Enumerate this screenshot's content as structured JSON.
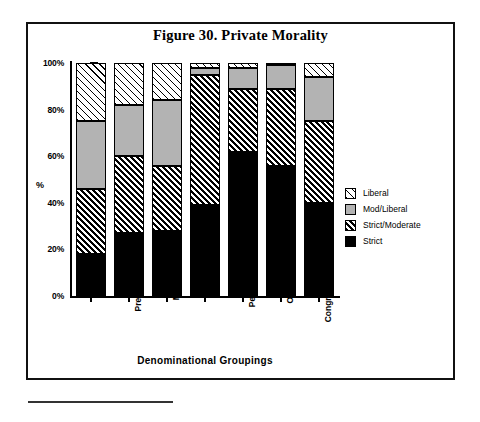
{
  "figure": {
    "title": "Figure 30. Private Morality",
    "frame_border_color": "#111111"
  },
  "chart_data": {
    "type": "bar",
    "subtype": "stacked-100-percent",
    "title": "Figure 30. Private Morality",
    "xlabel": "Denominational  Groupings",
    "ylabel": "%",
    "ylim": [
      0,
      100
    ],
    "ytick_labels": [
      "0%",
      "20%",
      "40%",
      "60%",
      "80%",
      "100%"
    ],
    "ytick_values": [
      0,
      20,
      40,
      60,
      80,
      100
    ],
    "yminor_step": 5,
    "grid": false,
    "legend_position": "right",
    "categories": [
      "C of I",
      "Presbyterian",
      "Methodist",
      "Baptistic",
      "Pent/Charis",
      "Other Pres",
      "Congregational"
    ],
    "series": [
      {
        "name": "Strict",
        "fill": "solid-black",
        "color": "#000000",
        "values": [
          18,
          27,
          28,
          39,
          62,
          56,
          40
        ]
      },
      {
        "name": "Strict/Moderate",
        "fill": "dense-diagonal-hatch",
        "color": "#000000",
        "values": [
          28,
          33,
          28,
          56,
          27,
          33,
          35
        ]
      },
      {
        "name": "Mod/Liberal",
        "fill": "solid-gray",
        "color": "#b3b3b3",
        "values": [
          29,
          22,
          28,
          3,
          9,
          10,
          19
        ]
      },
      {
        "name": "Liberal",
        "fill": "sparse-diagonal-hatch",
        "color": "#ffffff",
        "values": [
          25,
          18,
          16,
          2,
          2,
          1,
          6
        ]
      }
    ],
    "cumulative_tops": [
      [
        18,
        46,
        75,
        100
      ],
      [
        27,
        60,
        82,
        100
      ],
      [
        28,
        56,
        84,
        100
      ],
      [
        39,
        95,
        98,
        100
      ],
      [
        62,
        89,
        98,
        100
      ],
      [
        56,
        89,
        99,
        100
      ],
      [
        40,
        75,
        94,
        100
      ]
    ]
  },
  "legend": {
    "items": [
      {
        "label": "Liberal",
        "swatch": "sparse-diagonal-hatch"
      },
      {
        "label": "Mod/Liberal",
        "swatch": "solid-gray"
      },
      {
        "label": "Strict/Moderate",
        "swatch": "dense-diagonal-hatch"
      },
      {
        "label": "Strict",
        "swatch": "solid-black"
      }
    ]
  }
}
